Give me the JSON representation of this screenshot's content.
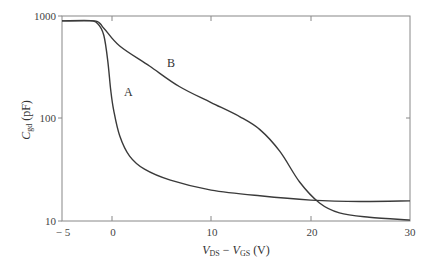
{
  "chart_data": {
    "type": "line",
    "title": "",
    "xlabel": "V_DS − V_GS (V)",
    "ylabel": "C_gd (pF)",
    "xlim": [
      -5,
      30
    ],
    "ylim": [
      10,
      1000
    ],
    "yscale": "log",
    "grid": false,
    "legend": "inline labels",
    "x_ticks": [
      -5,
      0,
      10,
      20,
      30
    ],
    "x_tick_labels": [
      "−5",
      "0",
      "10",
      "20",
      "30"
    ],
    "y_ticks": [
      10,
      100,
      1000
    ],
    "y_tick_labels": [
      "10",
      "100",
      "1000"
    ],
    "series": [
      {
        "name": "A",
        "x": [
          -5,
          -2.2,
          -1.4,
          -0.8,
          -0.4,
          -0.1,
          0.2,
          0.8,
          1.8,
          3.3,
          5.9,
          10,
          14.9,
          20,
          25,
          30
        ],
        "y": [
          895,
          895,
          840,
          650,
          370,
          190,
          120,
          68,
          43,
          32,
          25,
          20,
          17.6,
          16,
          15.5,
          15.7
        ]
      },
      {
        "name": "B",
        "x": [
          -5,
          -1.7,
          -0.8,
          0.8,
          3.8,
          6.8,
          10,
          12.9,
          14.9,
          16.9,
          18.9,
          20.9,
          22.9,
          25.9,
          30
        ],
        "y": [
          895,
          895,
          760,
          510,
          325,
          205,
          143,
          104,
          78,
          48,
          24,
          15,
          12,
          10.9,
          10.2
        ]
      }
    ],
    "annotations": [
      {
        "text": "A",
        "x": 1.0,
        "y": 180
      },
      {
        "text": "B",
        "x": 5.8,
        "y": 350
      }
    ]
  },
  "labels": {
    "x_axis": "V_DS − V_GS (V)",
    "x_axis_main1": "V",
    "x_axis_sub1": "DS",
    "x_axis_minus": " − ",
    "x_axis_main2": "V",
    "x_axis_sub2": "GS",
    "x_axis_unit": " (V)",
    "y_axis_main": "C",
    "y_axis_sub": "gd",
    "y_axis_unit": " (pF)",
    "series_a": "A",
    "series_b": "B",
    "y_1000": "1000",
    "y_100": "100",
    "y_10": "10",
    "x_m5": "− 5",
    "x_0": "0",
    "x_10": "10",
    "x_20": "20",
    "x_30": "30"
  }
}
